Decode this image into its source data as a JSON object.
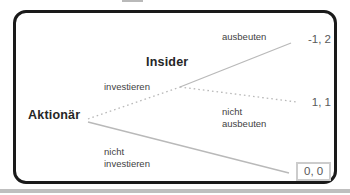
{
  "diagram": {
    "type": "extensive-form-game-tree",
    "nodes": {
      "root_player": "Aktionär",
      "second_player": "Insider"
    },
    "branches": {
      "invest": "investieren",
      "not_invest": "nicht\ninvestieren",
      "exploit": "ausbeuten",
      "not_exploit": "nicht\nausbeuten"
    },
    "payoffs": {
      "exploit": "-1, 2",
      "not_exploit": "1, 1",
      "not_invest": "0, 0"
    },
    "colors": {
      "card_border": "#1a1a1a",
      "tree_line": "#b9b9b9",
      "branch_label": "#3f3f3f",
      "payoff_text": "#595959",
      "payoff_box_border": "#cccccc"
    }
  }
}
